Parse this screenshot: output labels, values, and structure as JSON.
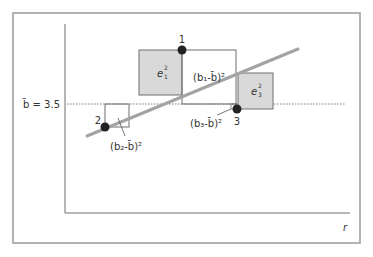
{
  "diagram": {
    "mean_label": "b̄ = 3.5",
    "mean_value": 3.5,
    "x_axis_label": "r",
    "points": [
      {
        "id": "1",
        "label": "1"
      },
      {
        "id": "2",
        "label": "2"
      },
      {
        "id": "3",
        "label": "3"
      }
    ],
    "squares": {
      "e1": {
        "base": "e",
        "sup": "2",
        "sub": "1"
      },
      "e3": {
        "base": "e",
        "sup": "2",
        "sub": "3"
      },
      "b1": {
        "text": "(b₁-b̄)²"
      },
      "b2": {
        "text": "(b₂-b̄)²"
      },
      "b3": {
        "text": "(b₃-b̄)²"
      }
    },
    "colors": {
      "frame": "#9a9a9a",
      "axis": "#6e6e6e",
      "regression_line": "#a3a3a3",
      "shaded_square": "#d9d9d9",
      "square_outline": "#6e6e6e",
      "point": "#222222",
      "text": "#333333"
    }
  }
}
